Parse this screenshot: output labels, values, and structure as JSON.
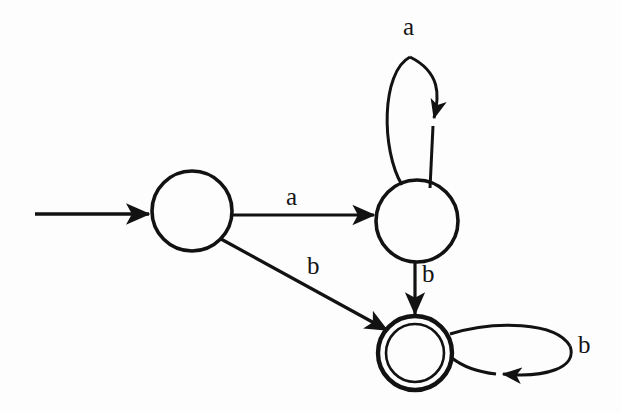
{
  "diagram": {
    "type": "finite-state-machine",
    "background_color": "#fdfdfd",
    "ink_color": "#121212",
    "alphabet": [
      "a",
      "b"
    ],
    "states": [
      {
        "id": "q0",
        "label": "",
        "kind": "start",
        "accepting": false,
        "cx": 192,
        "cy": 211,
        "r": 40
      },
      {
        "id": "q1",
        "label": "",
        "kind": "normal",
        "accepting": false,
        "cx": 417,
        "cy": 221,
        "r": 41
      },
      {
        "id": "q2",
        "label": "",
        "kind": "accepting",
        "accepting": true,
        "cx": 415,
        "cy": 353,
        "r": 37,
        "inner_r": 29
      }
    ],
    "start_arrow": {
      "name": "start-arrow",
      "from_x": 35,
      "to_x": 151,
      "y": 214
    },
    "transitions": [
      {
        "id": "t-q0-q1",
        "from": "q0",
        "to": "q1",
        "symbol": "a",
        "shape": "straight-horizontal",
        "label_x": 286,
        "label_y": 184
      },
      {
        "id": "t-q0-q2",
        "from": "q0",
        "to": "q2",
        "symbol": "b",
        "shape": "straight-diagonal",
        "label_x": 307,
        "label_y": 253
      },
      {
        "id": "t-q1-q1",
        "from": "q1",
        "to": "q1",
        "symbol": "a",
        "shape": "self-loop-top",
        "label_x": 403,
        "label_y": 14
      },
      {
        "id": "t-q1-q2",
        "from": "q1",
        "to": "q2",
        "symbol": "b",
        "shape": "straight-vertical",
        "label_x": 422,
        "label_y": 261
      },
      {
        "id": "t-q2-q2",
        "from": "q2",
        "to": "q2",
        "symbol": "b",
        "shape": "self-loop-right",
        "label_x": 578,
        "label_y": 332
      }
    ]
  }
}
